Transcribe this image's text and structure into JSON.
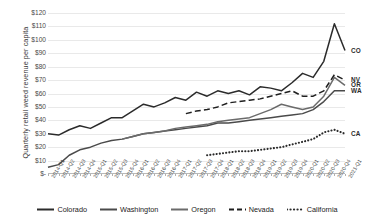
{
  "chart_data": {
    "type": "line",
    "title": "",
    "xlabel": "",
    "ylabel": "Quarterly retail weed revenue per capita",
    "ylim": [
      0,
      120
    ],
    "ytick_labels": [
      "$120",
      "$110",
      "$100",
      "$90",
      "$80",
      "$70",
      "$60",
      "$50",
      "$40",
      "$30",
      "$20",
      "$10",
      "$-"
    ],
    "ytick_values": [
      120,
      110,
      100,
      90,
      80,
      70,
      60,
      50,
      40,
      30,
      20,
      10,
      0
    ],
    "grid": true,
    "legend_position": "bottom",
    "categories": [
      "2014-Q1",
      "2014-Q2",
      "2014-Q3",
      "2014-Q4",
      "2015-Q1",
      "2015-Q2",
      "2015-Q3",
      "2015-Q4",
      "2016-Q1",
      "2016-Q2",
      "2016-Q3",
      "2016-Q4",
      "2017-Q1",
      "2017-Q2",
      "2017-Q3",
      "2017-Q4",
      "2018-Q1",
      "2018-Q2",
      "2018-Q3",
      "2018-Q4",
      "2019-Q1",
      "2019-Q2",
      "2019-Q3",
      "2019-Q4",
      "2020-Q1",
      "2020-Q2",
      "2020-Q3",
      "2020-Q4",
      "2021-Q1"
    ],
    "series": [
      {
        "name": "Colorado",
        "short": "CO",
        "style": "solid",
        "color": "#2b2b2b",
        "values": [
          30,
          29,
          33,
          36,
          34,
          38,
          42,
          42,
          47,
          52,
          50,
          53,
          57,
          55,
          61,
          58,
          62,
          60,
          62,
          59,
          65,
          64,
          62,
          68,
          75,
          72,
          84,
          112,
          92
        ]
      },
      {
        "name": "Washington",
        "short": "WA",
        "style": "solid",
        "color": "#4a4a4a",
        "values": [
          5,
          7,
          14,
          18,
          20,
          23,
          25,
          26,
          28,
          30,
          31,
          32,
          33,
          34,
          35,
          36,
          38,
          38,
          39,
          40,
          41,
          42,
          43,
          44,
          45,
          48,
          54,
          62,
          62
        ]
      },
      {
        "name": "Oregon",
        "short": "OR",
        "style": "solid",
        "color": "#6b6b6b",
        "values": [
          null,
          null,
          null,
          null,
          null,
          null,
          null,
          26,
          28,
          30,
          31,
          32,
          34,
          35,
          36,
          37,
          39,
          40,
          41,
          42,
          45,
          48,
          52,
          50,
          48,
          50,
          58,
          72,
          66
        ]
      },
      {
        "name": "Nevada",
        "short": "NV",
        "style": "dashed",
        "color": "#1f1f1f",
        "values": [
          null,
          null,
          null,
          null,
          null,
          null,
          null,
          null,
          null,
          null,
          null,
          null,
          null,
          45,
          47,
          48,
          50,
          53,
          54,
          55,
          56,
          58,
          60,
          62,
          58,
          58,
          62,
          74,
          70
        ]
      },
      {
        "name": "California",
        "short": "CA",
        "style": "dotted",
        "color": "#2b2b2b",
        "values": [
          null,
          null,
          null,
          null,
          null,
          null,
          null,
          null,
          null,
          null,
          null,
          null,
          null,
          null,
          null,
          14,
          15,
          16,
          17,
          17,
          18,
          19,
          20,
          22,
          24,
          26,
          31,
          33,
          30
        ]
      }
    ]
  },
  "legend": {
    "items": [
      {
        "label": "Colorado"
      },
      {
        "label": "Washington"
      },
      {
        "label": "Oregon"
      },
      {
        "label": "Nevada"
      },
      {
        "label": "California"
      }
    ]
  },
  "end_labels": [
    {
      "text": "CO"
    },
    {
      "text": "NV"
    },
    {
      "text": "OR"
    },
    {
      "text": "WA"
    },
    {
      "text": "CA"
    }
  ]
}
